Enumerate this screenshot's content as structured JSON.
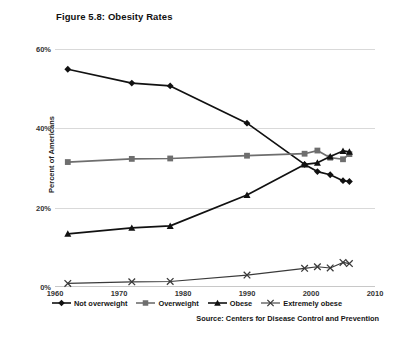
{
  "figure": {
    "title": "Figure 5.8: Obesity Rates",
    "source": "Source: Centers for Disease Control and Prevention"
  },
  "chart_data": {
    "type": "line",
    "title": "Figure 5.8: Obesity Rates",
    "xlabel": "",
    "ylabel": "Percent of Americans",
    "xlim": [
      1960,
      2010
    ],
    "ylim": [
      0,
      60
    ],
    "xticks": [
      1960,
      1970,
      1980,
      1990,
      2000,
      2010
    ],
    "yticks": [
      0,
      20,
      40,
      60
    ],
    "ytick_labels": [
      "0%",
      "20%",
      "40%",
      "60%"
    ],
    "xtick_labels": [
      "1960",
      "1970",
      "1980",
      "1990",
      "2000",
      "2010"
    ],
    "grid": true,
    "legend_position": "bottom",
    "series": [
      {
        "name": "Not overweight",
        "marker": "diamond",
        "color": "#111111",
        "points": [
          {
            "x": 1962,
            "y": 54.9
          },
          {
            "x": 1972,
            "y": 51.4
          },
          {
            "x": 1978,
            "y": 50.7
          },
          {
            "x": 1990,
            "y": 41.3
          },
          {
            "x": 1999,
            "y": 30.9
          },
          {
            "x": 2001,
            "y": 29.1
          },
          {
            "x": 2003,
            "y": 28.3
          },
          {
            "x": 2005,
            "y": 26.8
          },
          {
            "x": 2006,
            "y": 26.6
          }
        ]
      },
      {
        "name": "Overweight",
        "marker": "square",
        "color": "#6e6e6e",
        "points": [
          {
            "x": 1962,
            "y": 31.5
          },
          {
            "x": 1972,
            "y": 32.3
          },
          {
            "x": 1978,
            "y": 32.4
          },
          {
            "x": 1990,
            "y": 33.1
          },
          {
            "x": 1999,
            "y": 33.6
          },
          {
            "x": 2001,
            "y": 34.4
          },
          {
            "x": 2003,
            "y": 32.6
          },
          {
            "x": 2005,
            "y": 32.2
          },
          {
            "x": 2006,
            "y": 33.5
          }
        ]
      },
      {
        "name": "Obese",
        "marker": "triangle",
        "color": "#111111",
        "points": [
          {
            "x": 1962,
            "y": 13.4
          },
          {
            "x": 1972,
            "y": 14.9
          },
          {
            "x": 1978,
            "y": 15.4
          },
          {
            "x": 1990,
            "y": 23.2
          },
          {
            "x": 1999,
            "y": 30.9
          },
          {
            "x": 2001,
            "y": 31.3
          },
          {
            "x": 2003,
            "y": 32.9
          },
          {
            "x": 2005,
            "y": 34.3
          },
          {
            "x": 2006,
            "y": 34.1
          }
        ]
      },
      {
        "name": "Extremely obese",
        "marker": "x",
        "color": "#3a3a3a",
        "points": [
          {
            "x": 1962,
            "y": 0.9
          },
          {
            "x": 1972,
            "y": 1.3
          },
          {
            "x": 1978,
            "y": 1.4
          },
          {
            "x": 1990,
            "y": 3.0
          },
          {
            "x": 1999,
            "y": 4.7
          },
          {
            "x": 2001,
            "y": 5.1
          },
          {
            "x": 2003,
            "y": 4.8
          },
          {
            "x": 2005,
            "y": 6.2
          },
          {
            "x": 2006,
            "y": 5.9
          }
        ]
      }
    ]
  }
}
